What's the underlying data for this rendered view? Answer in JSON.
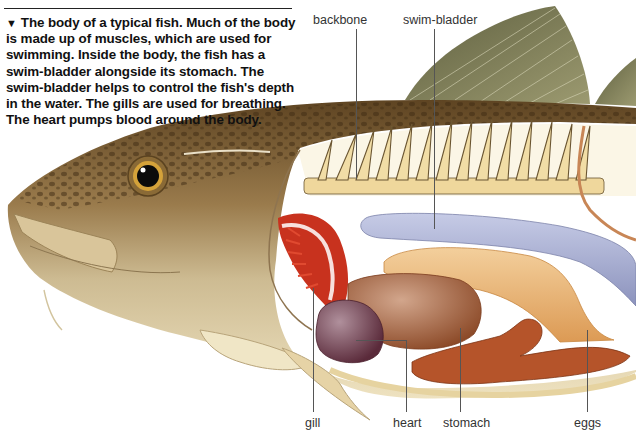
{
  "figure": {
    "caption_marker": "▼",
    "caption": "The body of a typical fish. Much of the body is made up of muscles, which are used for swimming. Inside the body, the fish has a swim-bladder alongside its stomach. The swim-bladder helps to control the fish's depth in the water. The gills are used for breathing. The heart pumps blood around the body."
  },
  "labels": {
    "top": [
      {
        "id": "backbone",
        "text": "backbone"
      },
      {
        "id": "swim-bladder",
        "text": "swim-bladder"
      }
    ],
    "bottom": [
      {
        "id": "gill",
        "text": "gill"
      },
      {
        "id": "heart",
        "text": "heart"
      },
      {
        "id": "stomach",
        "text": "stomach"
      },
      {
        "id": "eggs",
        "text": "eggs"
      }
    ]
  },
  "colors": {
    "skin_back": "#7a5a2c",
    "skin_belly": "#e8d9b0",
    "fin": "#7c7a52",
    "gill": "#c8321e",
    "heart": "#6e3a4a",
    "liver": "#a65a35",
    "stomach": "#b5542a",
    "swim_bladder": "#a9b0d2",
    "eggs": "#e8b070",
    "bone": "#efd79c"
  }
}
